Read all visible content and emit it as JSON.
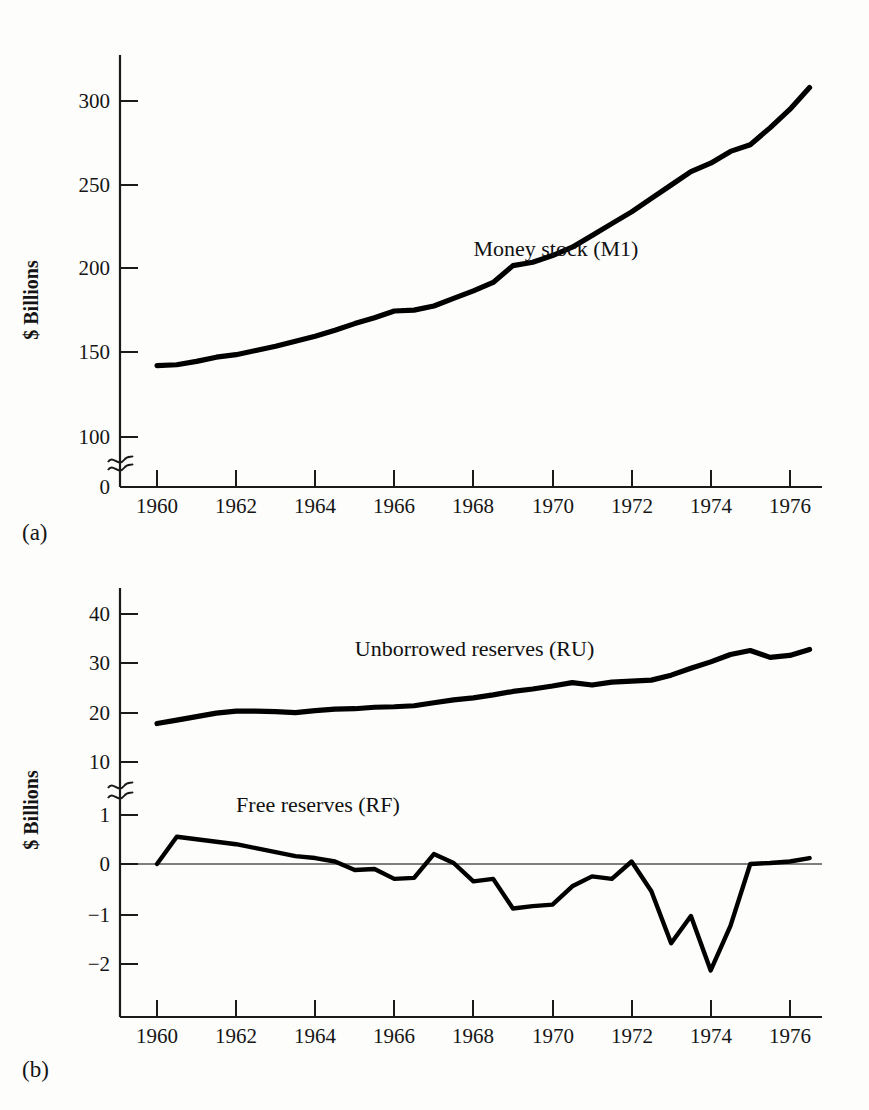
{
  "figure": {
    "panels": [
      {
        "caption": "(a)",
        "ylabel": "$ Billions"
      },
      {
        "caption": "(b)",
        "ylabel": "$ Billions"
      }
    ]
  },
  "chart_data": [
    {
      "type": "line",
      "panel": "(a)",
      "title": "",
      "xlabel": "",
      "ylabel": "$ Billions",
      "xlim": [
        1959.4,
        1977.2
      ],
      "ylim": [
        0,
        330
      ],
      "grid": false,
      "legend": "inline-annotation",
      "axis_break_y": true,
      "xticks": [
        1960,
        1962,
        1964,
        1966,
        1968,
        1970,
        1972,
        1974,
        1976
      ],
      "xticklabels": [
        "1960",
        "1962",
        "1964",
        "1966",
        "1968",
        "1970",
        "1972",
        "1974",
        "1976"
      ],
      "yticks": [
        0,
        100,
        150,
        200,
        250,
        300
      ],
      "yticklabels": [
        "0",
        "100",
        "150",
        "200",
        "250",
        "300"
      ],
      "series": [
        {
          "name": "Money stock (M1)",
          "label_x": 1968.0,
          "label_y": 208,
          "x": [
            1960.0,
            1960.5,
            1961.0,
            1961.5,
            1962.0,
            1962.5,
            1963.0,
            1963.5,
            1964.0,
            1964.5,
            1965.0,
            1965.5,
            1966.0,
            1966.5,
            1967.0,
            1967.5,
            1968.0,
            1968.5,
            1969.0,
            1969.5,
            1970.0,
            1970.5,
            1971.0,
            1971.5,
            1972.0,
            1972.5,
            1973.0,
            1973.5,
            1974.0,
            1974.5,
            1975.0,
            1975.5,
            1976.0,
            1976.5
          ],
          "values": [
            142.5,
            143.0,
            145.0,
            147.5,
            149.0,
            151.5,
            154.0,
            157.0,
            160.0,
            163.5,
            167.5,
            171.0,
            175.0,
            175.5,
            178.0,
            182.5,
            187.0,
            192.0,
            202.0,
            204.0,
            208.0,
            213.0,
            220.0,
            227.0,
            234.0,
            242.0,
            250.0,
            258.0,
            263.0,
            270.0,
            274.0,
            284.0,
            295.0,
            308.0
          ]
        }
      ]
    },
    {
      "type": "line",
      "panel": "(b)",
      "title": "",
      "xlabel": "",
      "ylabel": "$ Billions",
      "xlim": [
        1959.4,
        1977.2
      ],
      "grid": false,
      "legend": "inline-annotation",
      "axis_break_y": true,
      "y_upper_range": [
        10,
        45
      ],
      "y_lower_range": [
        -2.4,
        1.4
      ],
      "xticks": [
        1960,
        1962,
        1964,
        1966,
        1968,
        1970,
        1972,
        1974,
        1976
      ],
      "xticklabels": [
        "1960",
        "1962",
        "1964",
        "1966",
        "1968",
        "1970",
        "1972",
        "1974",
        "1976"
      ],
      "yticks_upper": [
        10,
        20,
        30,
        40
      ],
      "yticklabels_upper": [
        "10",
        "20",
        "30",
        "40"
      ],
      "yticks_lower": [
        -2,
        -1,
        0,
        1
      ],
      "yticklabels_lower": [
        "−2",
        "−1",
        "0",
        "1"
      ],
      "series": [
        {
          "name": "Unborrowed reserves (RU)",
          "label_x": 1965.0,
          "label_y": 31.5,
          "x": [
            1960.0,
            1960.5,
            1961.0,
            1961.5,
            1962.0,
            1962.5,
            1963.0,
            1963.5,
            1964.0,
            1964.5,
            1965.0,
            1965.5,
            1966.0,
            1966.5,
            1967.0,
            1967.5,
            1968.0,
            1968.5,
            1969.0,
            1969.5,
            1970.0,
            1970.5,
            1971.0,
            1971.5,
            1972.0,
            1972.5,
            1973.0,
            1973.5,
            1974.0,
            1974.5,
            1975.0,
            1975.5,
            1976.0,
            1976.5
          ],
          "values": [
            17.8,
            18.5,
            19.2,
            19.9,
            20.3,
            20.3,
            20.2,
            20.0,
            20.4,
            20.7,
            20.8,
            21.1,
            21.2,
            21.4,
            22.0,
            22.6,
            23.0,
            23.6,
            24.3,
            24.8,
            25.4,
            26.1,
            25.6,
            26.2,
            26.4,
            26.6,
            27.6,
            29.0,
            30.3,
            31.8,
            32.6,
            31.2,
            31.6,
            32.8
          ]
        },
        {
          "name": "Free reserves (RF)",
          "label_x": 1962.0,
          "label_y": 1.05,
          "x": [
            1960.0,
            1960.5,
            1961.0,
            1961.5,
            1962.0,
            1962.5,
            1963.0,
            1963.5,
            1964.0,
            1964.5,
            1965.0,
            1965.5,
            1966.0,
            1966.5,
            1967.0,
            1967.5,
            1968.0,
            1968.5,
            1969.0,
            1969.5,
            1970.0,
            1970.5,
            1971.0,
            1971.5,
            1972.0,
            1972.5,
            1973.0,
            1973.5,
            1974.0,
            1974.5,
            1975.0,
            1975.5,
            1976.0,
            1976.5
          ],
          "values": [
            0.0,
            0.55,
            0.5,
            0.45,
            0.4,
            0.32,
            0.24,
            0.16,
            0.12,
            0.05,
            -0.12,
            -0.1,
            -0.3,
            -0.28,
            0.2,
            0.02,
            -0.35,
            -0.3,
            -0.9,
            -0.85,
            -0.82,
            -0.45,
            -0.25,
            -0.3,
            0.05,
            -0.55,
            -1.6,
            -1.05,
            -2.15,
            -1.25,
            0.0,
            0.02,
            0.05,
            0.12
          ]
        }
      ]
    }
  ]
}
